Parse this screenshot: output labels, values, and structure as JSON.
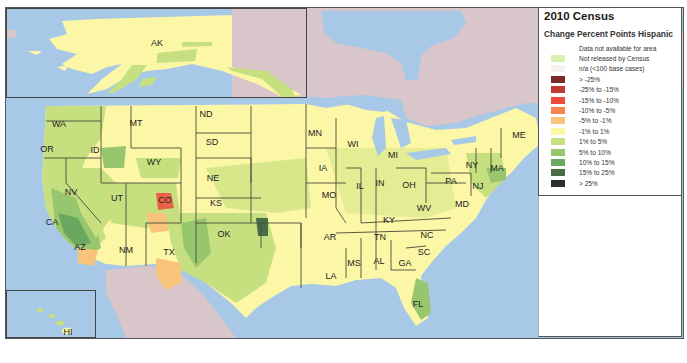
{
  "legend": {
    "title": "2010 Census",
    "subtitle": "Change Percent Points Hispanic",
    "items": [
      {
        "label": "Data not available for area",
        "color": "none"
      },
      {
        "label": "Not released by Census",
        "color": "#d7efb0"
      },
      {
        "label": "n/a (<100 base cases)",
        "color": "#f7f2ee"
      },
      {
        "label": "> -25%",
        "color": "#7a2a28"
      },
      {
        "label": "-25% to -15%",
        "color": "#c23a34"
      },
      {
        "label": "-15% to -10%",
        "color": "#ef4a3c"
      },
      {
        "label": "-10% to -5%",
        "color": "#f5844f"
      },
      {
        "label": "-5% to -1%",
        "color": "#f8c47c"
      },
      {
        "label": "-1% to 1%",
        "color": "#fbf7a6"
      },
      {
        "label": "1% to 5%",
        "color": "#c7e07f"
      },
      {
        "label": "5% to 10%",
        "color": "#98c66e"
      },
      {
        "label": "10% to 15%",
        "color": "#6aa85f"
      },
      {
        "label": "15% to 25%",
        "color": "#476e46"
      },
      {
        "label": "> 25%",
        "color": "#273326"
      }
    ]
  },
  "colors": {
    "water": "#a7c8e6",
    "foreign_land": "#d8c6cb",
    "state_border": "#4a4a3a"
  },
  "insets": {
    "alaska": {
      "label": "AK"
    },
    "hawaii": {
      "label": "HI"
    }
  },
  "states": [
    {
      "abbr": "WA",
      "x": 53,
      "y": 116
    },
    {
      "abbr": "OR",
      "x": 41,
      "y": 141
    },
    {
      "abbr": "ID",
      "x": 89,
      "y": 142
    },
    {
      "abbr": "MT",
      "x": 130,
      "y": 115
    },
    {
      "abbr": "WY",
      "x": 148,
      "y": 154
    },
    {
      "abbr": "ND",
      "x": 200,
      "y": 106
    },
    {
      "abbr": "SD",
      "x": 206,
      "y": 134
    },
    {
      "abbr": "NE",
      "x": 207,
      "y": 170
    },
    {
      "abbr": "KS",
      "x": 210,
      "y": 195
    },
    {
      "abbr": "OK",
      "x": 218,
      "y": 226
    },
    {
      "abbr": "TX",
      "x": 163,
      "y": 244
    },
    {
      "abbr": "NM",
      "x": 120,
      "y": 242
    },
    {
      "abbr": "CO",
      "x": 159,
      "y": 192
    },
    {
      "abbr": "UT",
      "x": 111,
      "y": 190
    },
    {
      "abbr": "NV",
      "x": 65,
      "y": 184
    },
    {
      "abbr": "CA",
      "x": 46,
      "y": 214
    },
    {
      "abbr": "AZ",
      "x": 74,
      "y": 239
    },
    {
      "abbr": "MN",
      "x": 309,
      "y": 125
    },
    {
      "abbr": "WI",
      "x": 347,
      "y": 136
    },
    {
      "abbr": "IA",
      "x": 317,
      "y": 160
    },
    {
      "abbr": "MO",
      "x": 323,
      "y": 187
    },
    {
      "abbr": "AR",
      "x": 324,
      "y": 229
    },
    {
      "abbr": "LA",
      "x": 325,
      "y": 268
    },
    {
      "abbr": "MS",
      "x": 348,
      "y": 255
    },
    {
      "abbr": "AL",
      "x": 373,
      "y": 253
    },
    {
      "abbr": "TN",
      "x": 374,
      "y": 229
    },
    {
      "abbr": "KY",
      "x": 383,
      "y": 212
    },
    {
      "abbr": "IL",
      "x": 354,
      "y": 178
    },
    {
      "abbr": "IN",
      "x": 374,
      "y": 175
    },
    {
      "abbr": "OH",
      "x": 403,
      "y": 177
    },
    {
      "abbr": "MI",
      "x": 387,
      "y": 147
    },
    {
      "abbr": "WV",
      "x": 418,
      "y": 200
    },
    {
      "abbr": "PA",
      "x": 445,
      "y": 173
    },
    {
      "abbr": "NY",
      "x": 466,
      "y": 157
    },
    {
      "abbr": "MA",
      "x": 491,
      "y": 160
    },
    {
      "abbr": "NJ",
      "x": 472,
      "y": 178
    },
    {
      "abbr": "MD",
      "x": 456,
      "y": 196
    },
    {
      "abbr": "ME",
      "x": 513,
      "y": 127
    },
    {
      "abbr": "NC",
      "x": 421,
      "y": 227
    },
    {
      "abbr": "SC",
      "x": 418,
      "y": 244
    },
    {
      "abbr": "GA",
      "x": 399,
      "y": 255
    },
    {
      "abbr": "FL",
      "x": 412,
      "y": 296
    }
  ]
}
